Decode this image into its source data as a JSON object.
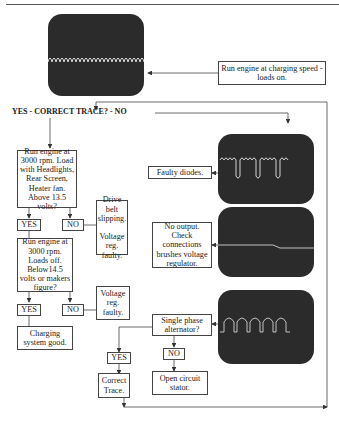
{
  "title_question": "YES - CORRECT TRACE? - NO",
  "start": {
    "instruction": "Run engine at charging speed - loads on.",
    "scope_trace": "normal-ripple-waveform"
  },
  "left_branch": {
    "test1": "Run engine at 3000 rpm. Load with Headlights, Rear Screen, Heater fan. Above 13.5 volts?",
    "test1_yes": "YES",
    "test1_no": "NO",
    "test1_no_result": "Drive belt slipping.\n\nVoltage reg. faulty.",
    "test2": "Run engine at 3000 rpm. Loads off. Below14.5 volts or makers figure?",
    "test2_yes": "YES",
    "test2_no": "NO",
    "test2_no_result": "Voltage reg. faulty.",
    "test2_yes_result": "Charging system good."
  },
  "right_branch": {
    "trace1_result": "Faulty diodes.",
    "trace1_scope": "faulty-diode-waveform",
    "trace2_result": "No output. Check connections brushes voltage regulator.",
    "trace2_scope": "flat-line-waveform",
    "trace3_scope": "single-phase-waveform",
    "trace3_question": "Single phase alternator?",
    "trace3_yes": "YES",
    "trace3_no": "NO",
    "trace3_yes_result": "Correct Trace.",
    "trace3_no_result": "Open circuit stator."
  },
  "colors": {
    "scope_screen": "#2b2b2b",
    "trace": "#e8e8e8",
    "lines": "#444444"
  }
}
